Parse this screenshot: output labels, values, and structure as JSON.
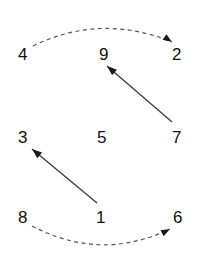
{
  "canvas": {
    "width": 198,
    "height": 263,
    "background": "#ffffff"
  },
  "style": {
    "label_color": "#111111",
    "solid_arrow_color": "#333333",
    "dashed_arrow_color": "#555555",
    "label_font_size": 17
  },
  "nodes": [
    {
      "id": "n4",
      "label": "4",
      "x": 18,
      "y": 46
    },
    {
      "id": "n9",
      "label": "9",
      "x": 99,
      "y": 46
    },
    {
      "id": "n2",
      "label": "2",
      "x": 172,
      "y": 46
    },
    {
      "id": "n3",
      "label": "3",
      "x": 18,
      "y": 129
    },
    {
      "id": "n5",
      "label": "5",
      "x": 97,
      "y": 129
    },
    {
      "id": "n7",
      "label": "7",
      "x": 172,
      "y": 129
    },
    {
      "id": "n8",
      "label": "8",
      "x": 18,
      "y": 209
    },
    {
      "id": "n1",
      "label": "1",
      "x": 96,
      "y": 209
    },
    {
      "id": "n6",
      "label": "6",
      "x": 173,
      "y": 209
    }
  ],
  "arrows": [
    {
      "id": "arrow-4-to-2",
      "from": "4",
      "to": "2",
      "style": "dashed",
      "path": "M 33 46 Q 101 13 172 42",
      "head_x": 172,
      "head_y": 42,
      "head_angle": 34
    },
    {
      "id": "arrow-7-to-9",
      "from": "7",
      "to": "9",
      "style": "solid",
      "path": "M 172 122 L 107 66",
      "head_x": 107,
      "head_y": 66,
      "head_angle": 221
    },
    {
      "id": "arrow-1-to-3",
      "from": "1",
      "to": "3",
      "style": "solid",
      "path": "M 97 203 L 32 149",
      "head_x": 32,
      "head_y": 149,
      "head_angle": 220
    },
    {
      "id": "arrow-8-to-6",
      "from": "8",
      "to": "6",
      "style": "dashed",
      "path": "M 32 226 Q 101 262 170 229",
      "head_x": 170,
      "head_y": 229,
      "head_angle": -28
    }
  ]
}
